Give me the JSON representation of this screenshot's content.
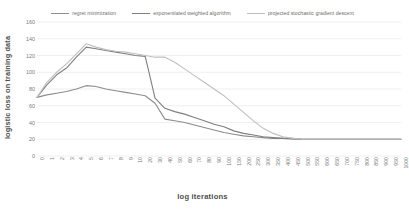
{
  "chart_data": {
    "type": "line",
    "title": "",
    "xlabel": "log iterations",
    "ylabel": "logistic loss on training data",
    "ylim": [
      0,
      160
    ],
    "yticks": [
      0,
      20,
      40,
      60,
      80,
      100,
      120,
      140,
      160
    ],
    "grid": true,
    "legend_position": "top",
    "categories": [
      "0",
      "1",
      "2",
      "3",
      "4",
      "5",
      "6",
      "7",
      "8",
      "9",
      "10",
      "20",
      "30",
      "40",
      "50",
      "60",
      "70",
      "80",
      "90",
      "100",
      "150",
      "200",
      "250",
      "300",
      "350",
      "400",
      "450",
      "500",
      "550",
      "600",
      "650",
      "700",
      "750",
      "800",
      "850",
      "900",
      "950",
      "1000"
    ],
    "series": [
      {
        "name": "regret minimization",
        "color": "#8c8c8c",
        "values": [
          70,
          73,
          75,
          77,
          80,
          84,
          83,
          80,
          78,
          76,
          74,
          72,
          63,
          44,
          42,
          40,
          37,
          34,
          31,
          28,
          26,
          24,
          23,
          22,
          21,
          21,
          20,
          20,
          20,
          20,
          20,
          20,
          20,
          20,
          20,
          20,
          20,
          20
        ]
      },
      {
        "name": "exponentiated weighted algorithm",
        "color": "#7f7f7f",
        "values": [
          70,
          85,
          97,
          105,
          118,
          130,
          128,
          126,
          124,
          122,
          120,
          119,
          69,
          57,
          53,
          50,
          46,
          42,
          38,
          35,
          30,
          27,
          25,
          23,
          22,
          21,
          21,
          20,
          20,
          20,
          20,
          20,
          20,
          20,
          20,
          20,
          20,
          20
        ]
      },
      {
        "name": "projected stochastic gradient descent",
        "color": "#bfbfbf",
        "values": [
          70,
          88,
          100,
          110,
          122,
          134,
          130,
          127,
          125,
          124,
          122,
          120,
          118,
          118,
          112,
          104,
          96,
          88,
          80,
          72,
          62,
          52,
          42,
          33,
          27,
          23,
          21,
          20,
          20,
          20,
          20,
          20,
          20,
          20,
          20,
          20,
          20,
          20
        ]
      }
    ]
  }
}
